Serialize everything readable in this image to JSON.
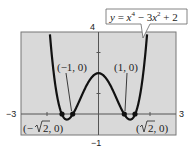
{
  "chart_data": {
    "type": "line",
    "title": "",
    "equation_label": "y = x^4 − 3x^2 + 2",
    "function": "x^4 - 3*x^2 + 2",
    "xlim": [
      -3,
      3
    ],
    "ylim": [
      -1,
      4
    ],
    "xlabel": "",
    "ylabel": "",
    "x_tick_labels": {
      "min": "−3",
      "max": "3"
    },
    "y_tick_labels": {
      "min": "−1",
      "max": "4"
    },
    "grid": false,
    "background": "#d9d9d9",
    "line_color": "#111111",
    "points": [
      {
        "x": -1.4142,
        "y": 0,
        "label": "(−√2, 0)"
      },
      {
        "x": -1,
        "y": 0,
        "label": "(−1, 0)"
      },
      {
        "x": 1,
        "y": 0,
        "label": "(1, 0)"
      },
      {
        "x": 1.4142,
        "y": 0,
        "label": "(√2, 0)"
      }
    ]
  },
  "labels": {
    "xmin": "−3",
    "xmax": "3",
    "ymin": "−1",
    "ymax": "4",
    "p_neg1": "(−1, 0)",
    "p_pos1": "(1, 0)",
    "p_negsqrt2_open": "(−",
    "p_negsqrt2_tail": "2, 0)",
    "p_sqrt2_open": "(",
    "p_sqrt2_tail": "2, 0)",
    "eq_y": "y",
    "eq_eq": " = ",
    "eq_x1": "x",
    "eq_exp1": "4",
    "eq_mid": " − 3",
    "eq_x2": "x",
    "eq_exp2": "2",
    "eq_end": " + 2"
  }
}
